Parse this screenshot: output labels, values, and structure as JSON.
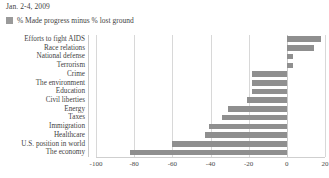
{
  "header": {
    "title": "Jan. 2-4, 2009"
  },
  "legend": {
    "position": "top-left",
    "swatch_color": "#9a9a9a",
    "entries": [
      {
        "label": "% Made progress minus % lost ground"
      }
    ]
  },
  "colors": {
    "bar": "#8f8f8f",
    "gridline": "#d8d8d8",
    "text": "#3f3f3f",
    "background": "#ffffff"
  },
  "chart_data": {
    "type": "bar",
    "orientation": "horizontal",
    "title": "Jan. 2-4, 2009",
    "subtitle": "",
    "xlabel": "",
    "ylabel": "",
    "xlim": [
      -100,
      20
    ],
    "grid": true,
    "legend_position": "top-left",
    "xticks": [
      -100,
      -80,
      -60,
      -40,
      -20,
      0,
      20
    ],
    "xtick_labels": [
      "-100",
      "-80",
      "-60",
      "-40",
      "-20",
      "0",
      "20"
    ],
    "categories": [
      "Efforts to fight AIDS",
      "Race relations",
      "National defense",
      "Terrorism",
      "Crime",
      "The environment",
      "Education",
      "Civil liberties",
      "Energy",
      "Taxes",
      "Immigration",
      "Healthcare",
      "U.S. position in world",
      "The economy"
    ],
    "series": [
      {
        "name": "% Made progress minus % lost ground",
        "values": [
          18,
          14,
          3,
          3,
          -18,
          -18,
          -18,
          -21,
          -31,
          -34,
          -41,
          -43,
          -60,
          -82
        ]
      }
    ]
  }
}
